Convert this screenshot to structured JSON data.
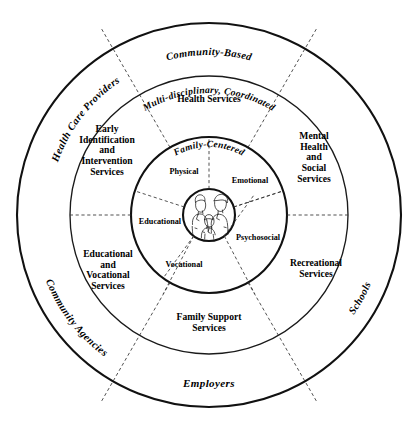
{
  "diagram": {
    "type": "concentric-rings",
    "center": {
      "x": 209,
      "y": 215
    },
    "radii": {
      "outer": 192,
      "community": 139,
      "services": 78,
      "core": 26
    }
  },
  "outer_ring": {
    "name": "community-context-ring",
    "labels": [
      {
        "key": "community_based",
        "text": "Community-Based",
        "position": "top"
      },
      {
        "key": "health_care_providers",
        "text": "Health Care Providers",
        "position": "upper-left"
      },
      {
        "key": "community_agencies",
        "text": "Community Agencies",
        "position": "right"
      },
      {
        "key": "schools",
        "text": "Schools",
        "position": "lower-left"
      },
      {
        "key": "employers",
        "text": "Employers",
        "position": "bottom"
      }
    ]
  },
  "services_ring": {
    "name": "services-ring",
    "banner": "Multi-disciplinary, Coordinated",
    "sectors": [
      {
        "key": "health_services",
        "text": "Health Services"
      },
      {
        "key": "mental_health",
        "text": "Mental\nHealth\nand\nSocial\nServices"
      },
      {
        "key": "recreational_services",
        "text": "Recreational\nServices"
      },
      {
        "key": "family_support",
        "text": "Family Support\nServices"
      },
      {
        "key": "educational_vocational",
        "text": "Educational\nand\nVocational\nServices"
      },
      {
        "key": "early_identification",
        "text": "Early\nIdentification\nand\nIntervention\nServices"
      }
    ]
  },
  "domains_ring": {
    "name": "domains-ring",
    "banner": "Family-Centered",
    "sectors": [
      {
        "key": "physical",
        "text": "Physical"
      },
      {
        "key": "emotional",
        "text": "Emotional"
      },
      {
        "key": "psychosocial",
        "text": "Psychosocial"
      },
      {
        "key": "vocational",
        "text": "Vocational"
      },
      {
        "key": "educational",
        "text": "Educational"
      }
    ]
  },
  "core": {
    "name": "family-illustration",
    "description": "family-illustration-icon",
    "figures": [
      "adult",
      "adult",
      "child"
    ]
  },
  "colors": {
    "ink": "#000000",
    "stroke_heavy": "#111111",
    "stroke_light": "#222222",
    "dashed": "#333333",
    "background": "#ffffff"
  }
}
